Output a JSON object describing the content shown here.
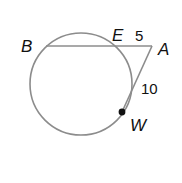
{
  "diagram": {
    "type": "circle-secant-tangent",
    "circle": {
      "cx": 81,
      "cy": 84,
      "r": 51,
      "stroke": "#8c8c8c"
    },
    "points": {
      "B": {
        "label": "B",
        "x": 46,
        "y": 46,
        "label_x": 21,
        "label_y": 52
      },
      "E": {
        "label": "E",
        "x": 117,
        "y": 46,
        "label_x": 112,
        "label_y": 41
      },
      "A": {
        "label": "A",
        "x": 152,
        "y": 46,
        "label_x": 158,
        "label_y": 55
      },
      "W": {
        "label": "W",
        "x": 122,
        "y": 112,
        "label_x": 130,
        "label_y": 131
      }
    },
    "segments": [
      {
        "from": "B",
        "to": "A",
        "kind": "secant"
      },
      {
        "from": "A",
        "to": "W",
        "kind": "tangent"
      }
    ],
    "measurements": {
      "EA": {
        "value": "5",
        "x": 135,
        "y": 41
      },
      "AW": {
        "value": "10",
        "x": 141,
        "y": 94
      }
    },
    "line_color": "#8c8c8c",
    "point_color": "#111111"
  }
}
